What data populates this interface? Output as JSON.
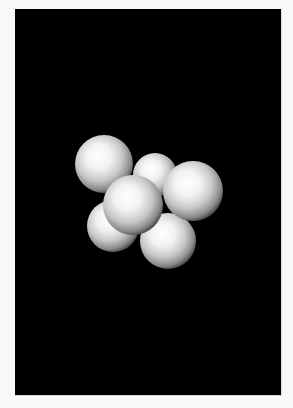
{
  "scene": {
    "background_color": "#000000",
    "border_color": "#f8f8f8",
    "sphere_color": "#ffffff",
    "sphere_shadow_color": "#3a3a3a",
    "spheres": [
      {
        "name": "sphere-back-top-middle",
        "cx": 140,
        "cy": 166,
        "r": 22
      },
      {
        "name": "sphere-top-left",
        "cx": 89,
        "cy": 155,
        "r": 29
      },
      {
        "name": "sphere-bottom-left",
        "cx": 98,
        "cy": 217,
        "r": 26
      },
      {
        "name": "sphere-bottom-right",
        "cx": 153,
        "cy": 232,
        "r": 28
      },
      {
        "name": "sphere-right",
        "cx": 178,
        "cy": 182,
        "r": 30
      },
      {
        "name": "sphere-center-front",
        "cx": 118,
        "cy": 196,
        "r": 30
      }
    ]
  }
}
